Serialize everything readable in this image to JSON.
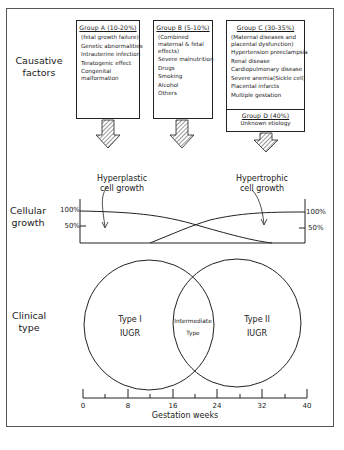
{
  "rows": {
    "causative": "Causative factors",
    "cellular": "Cellular growth",
    "clinical": "Clinical type"
  },
  "groups": [
    {
      "title": "Group A (10-20%)",
      "subtitle": "(fetal growth failure)",
      "items": [
        "Genetic abnormalities",
        "Intrauterine infection",
        "Teratogenic effect",
        "Congenital malformation"
      ]
    },
    {
      "title": "Group B (5-10%)",
      "subtitle": "(Combined maternal & fetal effects)",
      "items": [
        "Severe malnutrition",
        "Drugs",
        "Smoking",
        "Alcohol",
        "Others"
      ]
    },
    {
      "title": "Group C (30-35%)",
      "subtitle": "(Maternal diseases and placental dysfunction)",
      "items": [
        "Hypertension preeclampsia",
        "Renal disease",
        "Cardiopulmonary disease",
        "Severe anemia(Sickle cell)",
        "Placental infarcts",
        "Multiple gestation"
      ]
    },
    {
      "title": "Group D (40%)",
      "subtitle": "",
      "items": [
        "Unknown etiology"
      ]
    }
  ],
  "growth": {
    "hyperplastic": "Hyperplastic cell growth",
    "hypertrophic": "Hypertrophic cell growth",
    "y_100": "100%",
    "y_50": "50%"
  },
  "clinical": {
    "type1": "Type I",
    "type1_sub": "IUGR",
    "intermediate": "Intermediate",
    "intermediate_sub": "Type",
    "type2": "Type II",
    "type2_sub": "IUGR"
  },
  "axis": {
    "label": "Gestation weeks",
    "ticks": [
      "0",
      "8",
      "16",
      "24",
      "32",
      "40"
    ]
  }
}
